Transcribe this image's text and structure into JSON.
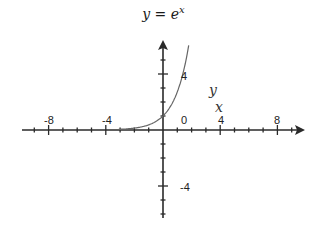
{
  "chart_data": {
    "type": "line",
    "title_parts": {
      "lhs": "y",
      "eq": " = ",
      "base": "e",
      "exp": "x"
    },
    "xlabel": "x",
    "ylabel": "y",
    "xlim": [
      -10,
      10
    ],
    "ylim": [
      -6,
      6.5
    ],
    "x_ticks": [
      -9,
      -8,
      -7,
      -6,
      -5,
      -4,
      -3,
      -2,
      -1,
      0,
      1,
      2,
      3,
      4,
      5,
      6,
      7,
      8,
      9
    ],
    "x_tick_labels": [
      "-8",
      "-4",
      "0",
      "4",
      "8"
    ],
    "y_ticks": [
      -6,
      -5,
      -4,
      -3,
      -2,
      -1,
      1,
      2,
      3,
      4,
      5
    ],
    "y_tick_labels": [
      "4",
      "-4"
    ],
    "grid": false,
    "legend": null,
    "series": [
      {
        "name": "y = e^x",
        "function": "exp(x)",
        "x": [
          -3,
          -2,
          -1,
          0,
          0.5,
          1,
          1.5,
          1.9
        ],
        "y": [
          0.05,
          0.14,
          0.37,
          1.0,
          1.65,
          2.72,
          4.48,
          6.69
        ]
      }
    ],
    "color": "#555555"
  },
  "labels": {
    "x_neg8": "-8",
    "x_neg4": "-4",
    "x_0": "0",
    "x_4": "4",
    "x_8": "8",
    "y_4": "4",
    "y_neg4": "-4",
    "x_axis_name": "x",
    "y_axis_name": "y"
  }
}
